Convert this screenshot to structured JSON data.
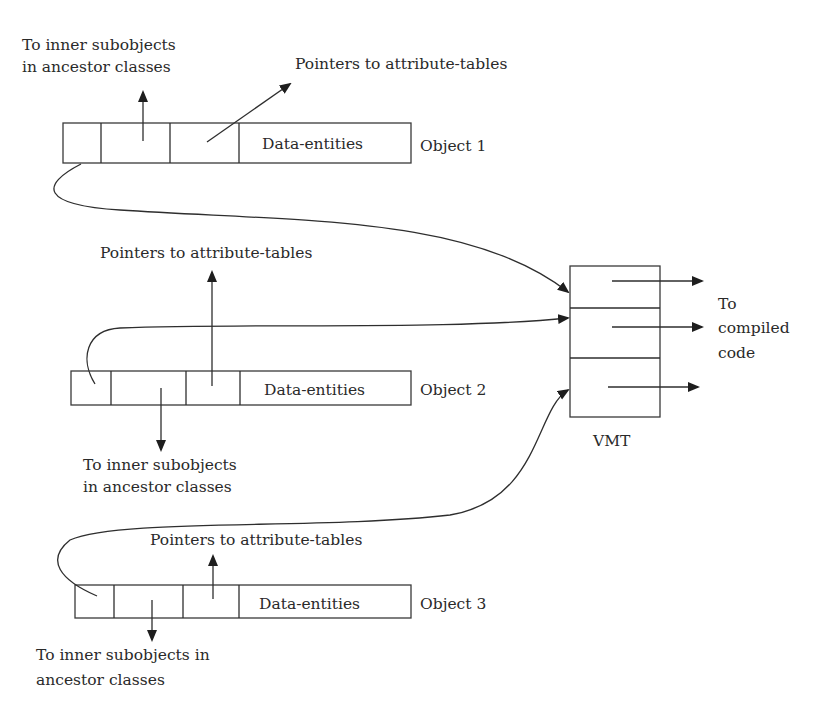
{
  "diagram": {
    "objects": [
      {
        "label": "Object 1",
        "data_cell": "Data-entities",
        "top_label": "To inner subobjects",
        "top_label_2": "in ancestor classes",
        "attr_label": "Pointers to attribute-tables"
      },
      {
        "label": "Object 2",
        "data_cell": "Data-entities",
        "attr_label": "Pointers to attribute-tables",
        "bottom_label": "To inner subobjects",
        "bottom_label_2": "in ancestor classes"
      },
      {
        "label": "Object 3",
        "data_cell": "Data-entities",
        "attr_label": "Pointers to attribute-tables",
        "bottom_label": "To inner subobjects in",
        "bottom_label_2": "ancestor classes"
      }
    ],
    "vmt": {
      "label": "VMT",
      "slots": 3,
      "target_label_1": "To",
      "target_label_2": "compiled",
      "target_label_3": "code"
    },
    "colors": {
      "stroke": "#3a3a3a",
      "text": "#2a2a2a",
      "background": "#ffffff"
    }
  }
}
